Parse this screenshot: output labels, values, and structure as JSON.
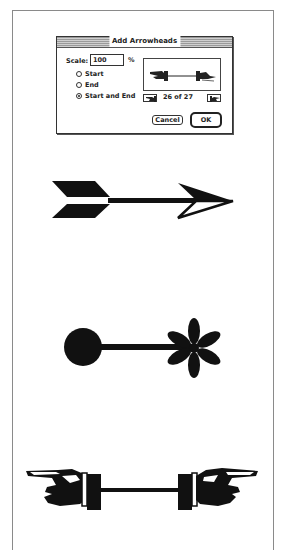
{
  "dialog": {
    "title": "Add Arrowheads",
    "scale_label": "Scale:",
    "scale_value": "100",
    "scale_unit": "%",
    "options": [
      {
        "label": "Start",
        "selected": false
      },
      {
        "label": "End",
        "selected": false
      },
      {
        "label": "Start and End",
        "selected": true
      }
    ],
    "preview_icon": "pointing-hands-arrowhead",
    "counter": "26 of 27",
    "prev_icon": "left-pointing-hand-icon",
    "next_icon": "right-pointing-hand-icon",
    "cancel_label": "Cancel",
    "ok_label": "OK"
  },
  "examples": [
    {
      "name": "feathered-arrow",
      "start": "fletching",
      "end": "open-arrowhead"
    },
    {
      "name": "ball-and-asterisk",
      "start": "filled-circle",
      "end": "asterisk"
    },
    {
      "name": "pointing-hands",
      "start": "left-pointing-hand",
      "end": "right-pointing-hand"
    }
  ],
  "colors": {
    "ink": "#111111",
    "frame": "#8a8a8a",
    "titlebar": "#bdbdbd"
  }
}
